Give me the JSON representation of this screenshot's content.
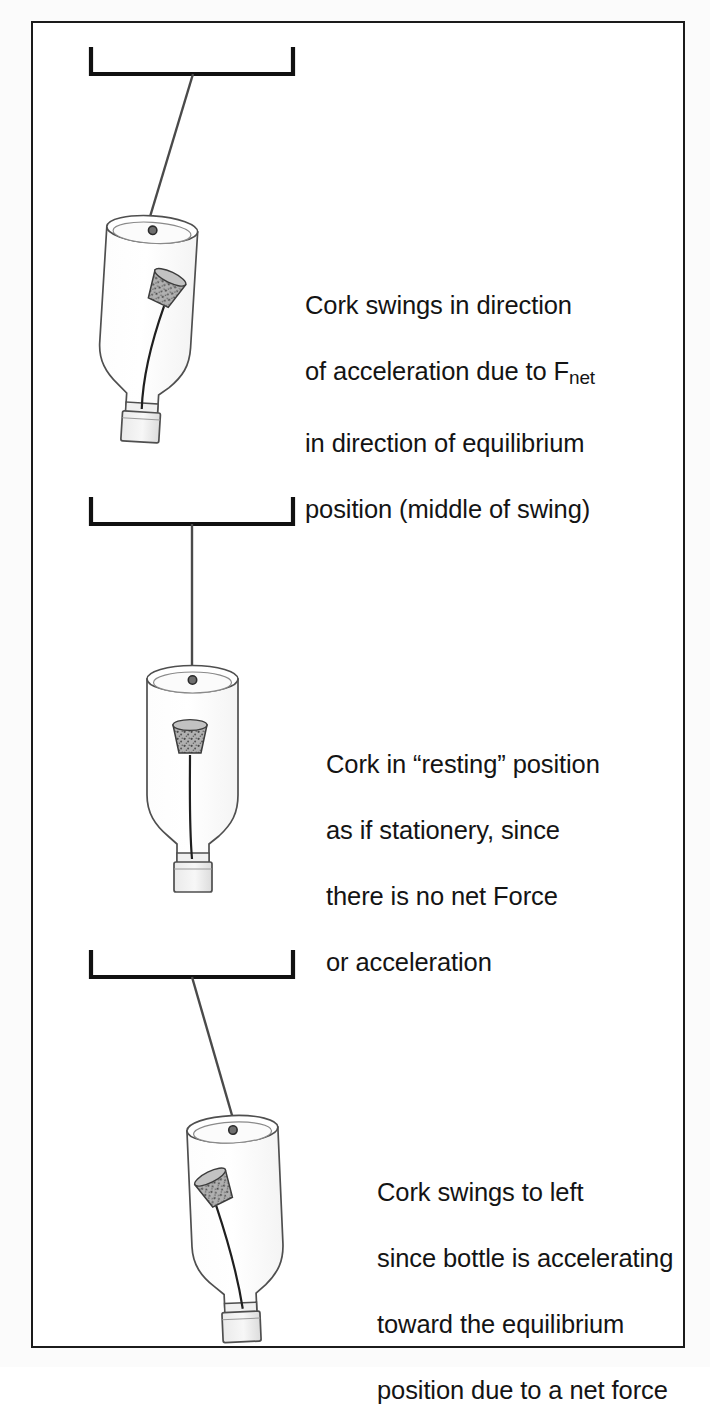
{
  "figure": {
    "background_color": "#ffffff",
    "page_background_color": "#fbfbfb",
    "border_color": "#1b1b1b",
    "ink_color": "#3a3a3a",
    "cork_fill_color": "#9a9a9a",
    "cap_fill_color": "#e3e3e3",
    "glass_fill_color": "#fcfcfc"
  },
  "panels": [
    {
      "id": "panel-1",
      "name": "cork-swings-right",
      "caption_line_1": "Cork swings in direction",
      "caption_line_2_prefix": "of acceleration due to F",
      "caption_line_2_subscript": "net",
      "caption_line_3": "in direction of equilibrium",
      "caption_line_4": "position (middle of swing)",
      "string_direction": "slanted-right",
      "cork_tilt": "leaning-right",
      "bracket_label": "support-bracket"
    },
    {
      "id": "panel-2",
      "name": "cork-at-rest",
      "caption_line_1": "Cork in “resting” position",
      "caption_line_2": "as if stationery, since",
      "caption_line_3": "there is no net Force",
      "caption_line_4": "or acceleration",
      "string_direction": "vertical",
      "cork_tilt": "upright",
      "bracket_label": "support-bracket"
    },
    {
      "id": "panel-3",
      "name": "cork-swings-left",
      "caption_line_1": "Cork swings to left",
      "caption_line_2": "since bottle is accelerating",
      "caption_line_3": "toward the equilibrium",
      "caption_line_4": "position due to a net force",
      "string_direction": "slanted-right",
      "cork_tilt": "leaning-left",
      "bracket_label": "support-bracket"
    }
  ]
}
